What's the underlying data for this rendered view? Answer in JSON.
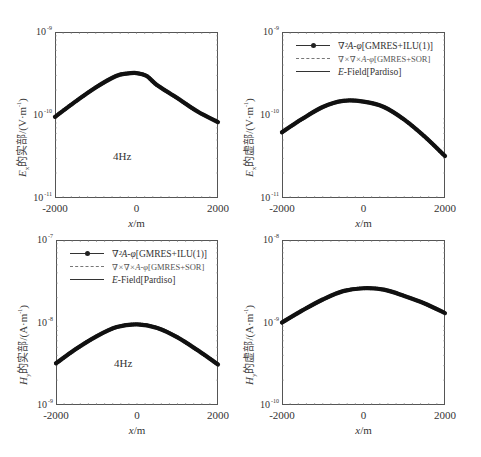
{
  "figure": {
    "caption_visible": "",
    "legend": {
      "entries": [
        {
          "label_math": "∇²A-φ",
          "label_rest": "[GMRES+ILU(1)]",
          "style": "solid-with-dots",
          "color": "#222222"
        },
        {
          "label_math": "∇×∇×A-φ",
          "label_rest": "[GMRES+SOR]",
          "style": "dashed",
          "color": "#777777"
        },
        {
          "label_math": "E",
          "label_rest": "-Field[Pardiso]",
          "style": "solid",
          "color": "#333333"
        }
      ]
    }
  },
  "chart_data": [
    {
      "type": "line",
      "id": "top-left",
      "title": "",
      "ylabel": "Ex的实部/(V·m⁻¹)",
      "ylabel_parts": {
        "sym": "E",
        "sub": "x",
        "text": "的实部/(V·m",
        "exp": "-1",
        "close": ")"
      },
      "xlabel": "x/m",
      "xlim": [
        -2000,
        2000
      ],
      "ylim": [
        1e-11,
        1e-09
      ],
      "yscale": "log",
      "xticks": [
        "-2000",
        "0",
        "2000"
      ],
      "yticks": [
        {
          "base": "10",
          "exp": "-9"
        },
        {
          "base": "10",
          "exp": "-10"
        },
        {
          "base": "10",
          "exp": "-11"
        }
      ],
      "annotation": "4Hz",
      "legend": false,
      "x": [
        -2000,
        -1500,
        -1000,
        -500,
        -250,
        0,
        250,
        500,
        1000,
        1500,
        2000
      ],
      "series": [
        {
          "name": "∇²A-φ[GMRES+ILU(1)]",
          "values": [
            9.5e-11,
            1.45e-10,
            2.15e-10,
            2.95e-10,
            3.15e-10,
            3.2e-10,
            2.95e-10,
            2.3e-10,
            1.6e-10,
            1.1e-10,
            8.2e-11
          ]
        },
        {
          "name": "∇×∇×A-φ[GMRES+SOR]",
          "values": [
            9.5e-11,
            1.45e-10,
            2.15e-10,
            2.95e-10,
            3.15e-10,
            3.2e-10,
            2.95e-10,
            2.3e-10,
            1.6e-10,
            1.1e-10,
            8.2e-11
          ]
        },
        {
          "name": "E-Field[Pardiso]",
          "values": [
            9.5e-11,
            1.45e-10,
            2.15e-10,
            2.95e-10,
            3.15e-10,
            3.2e-10,
            2.95e-10,
            2.3e-10,
            1.6e-10,
            1.1e-10,
            8.2e-11
          ]
        }
      ]
    },
    {
      "type": "line",
      "id": "top-right",
      "title": "",
      "ylabel": "Ex的虚部/(V·m⁻¹)",
      "ylabel_parts": {
        "sym": "E",
        "sub": "x",
        "text": "的虚部/(V·m",
        "exp": "-1",
        "close": ")"
      },
      "xlabel": "x/m",
      "xlim": [
        -2000,
        2000
      ],
      "ylim": [
        1e-11,
        1e-09
      ],
      "yscale": "log",
      "xticks": [
        "-2000",
        "0",
        "2000"
      ],
      "yticks": [
        {
          "base": "10",
          "exp": "-9"
        },
        {
          "base": "10",
          "exp": "-10"
        },
        {
          "base": "10",
          "exp": "-11"
        }
      ],
      "annotation": "",
      "legend": true,
      "x": [
        -2000,
        -1500,
        -1000,
        -500,
        0,
        500,
        1000,
        1500,
        2000
      ],
      "series": [
        {
          "name": "∇²A-φ[GMRES+ILU(1)]",
          "values": [
            6.2e-11,
            9e-11,
            1.25e-10,
            1.48e-10,
            1.45e-10,
            1.25e-10,
            8.8e-11,
            5.5e-11,
            3.2e-11
          ]
        },
        {
          "name": "∇×∇×A-φ[GMRES+SOR]",
          "values": [
            6.2e-11,
            9e-11,
            1.25e-10,
            1.48e-10,
            1.45e-10,
            1.25e-10,
            8.8e-11,
            5.5e-11,
            3.2e-11
          ]
        },
        {
          "name": "E-Field[Pardiso]",
          "values": [
            6.2e-11,
            9e-11,
            1.25e-10,
            1.48e-10,
            1.45e-10,
            1.25e-10,
            8.8e-11,
            5.5e-11,
            3.2e-11
          ]
        }
      ]
    },
    {
      "type": "line",
      "id": "bottom-left",
      "title": "",
      "ylabel": "Hy的实部/(A·m⁻¹)",
      "ylabel_parts": {
        "sym": "H",
        "sub": "y",
        "text": "的实部/(A·m",
        "exp": "-1",
        "close": ")"
      },
      "xlabel": "x/m",
      "xlim": [
        -2000,
        2000
      ],
      "ylim": [
        1e-09,
        1e-07
      ],
      "yscale": "log",
      "xticks": [
        "-2000",
        "0",
        "2000"
      ],
      "yticks": [
        {
          "base": "10",
          "exp": "-7"
        },
        {
          "base": "10",
          "exp": "-8"
        },
        {
          "base": "10",
          "exp": "-9"
        }
      ],
      "annotation": "4Hz",
      "legend": true,
      "x": [
        -2000,
        -1500,
        -1000,
        -500,
        0,
        500,
        1000,
        1500,
        2000
      ],
      "series": [
        {
          "name": "∇²A-φ[GMRES+ILU(1)]",
          "values": [
            3.2e-09,
            4.8e-09,
            6.8e-09,
            8.8e-09,
            9.5e-09,
            8.6e-09,
            6.6e-09,
            4.6e-09,
            3.1e-09
          ]
        },
        {
          "name": "∇×∇×A-φ[GMRES+SOR]",
          "values": [
            3.2e-09,
            4.8e-09,
            6.8e-09,
            8.8e-09,
            9.5e-09,
            8.6e-09,
            6.6e-09,
            4.6e-09,
            3.1e-09
          ]
        },
        {
          "name": "E-Field[Pardiso]",
          "values": [
            3.2e-09,
            4.8e-09,
            6.8e-09,
            8.8e-09,
            9.5e-09,
            8.6e-09,
            6.6e-09,
            4.6e-09,
            3.1e-09
          ]
        }
      ]
    },
    {
      "type": "line",
      "id": "bottom-right",
      "title": "",
      "ylabel": "Hy的虚部/(A·m⁻¹)",
      "ylabel_parts": {
        "sym": "H",
        "sub": "y",
        "text": "的虚部/(A·m",
        "exp": "-1",
        "close": ")"
      },
      "xlabel": "x/m",
      "xlim": [
        -2000,
        2000
      ],
      "ylim": [
        1e-10,
        1e-08
      ],
      "yscale": "log",
      "xticks": [
        "-2000",
        "0",
        "2000"
      ],
      "yticks": [
        {
          "base": "10",
          "exp": "-8"
        },
        {
          "base": "10",
          "exp": "-9"
        },
        {
          "base": "10",
          "exp": "-10"
        }
      ],
      "annotation": "",
      "legend": false,
      "x": [
        -2000,
        -1500,
        -1000,
        -500,
        0,
        500,
        1000,
        1500,
        2000
      ],
      "series": [
        {
          "name": "∇²A-φ[GMRES+ILU(1)]",
          "values": [
            1e-09,
            1.4e-09,
            1.9e-09,
            2.4e-09,
            2.6e-09,
            2.5e-09,
            2.1e-09,
            1.7e-09,
            1.3e-09
          ]
        },
        {
          "name": "∇×∇×A-φ[GMRES+SOR]",
          "values": [
            1e-09,
            1.4e-09,
            1.9e-09,
            2.4e-09,
            2.6e-09,
            2.5e-09,
            2.1e-09,
            1.7e-09,
            1.3e-09
          ]
        },
        {
          "name": "E-Field[Pardiso]",
          "values": [
            1e-09,
            1.4e-09,
            1.9e-09,
            2.4e-09,
            2.6e-09,
            2.5e-09,
            2.1e-09,
            1.7e-09,
            1.3e-09
          ]
        }
      ]
    }
  ]
}
